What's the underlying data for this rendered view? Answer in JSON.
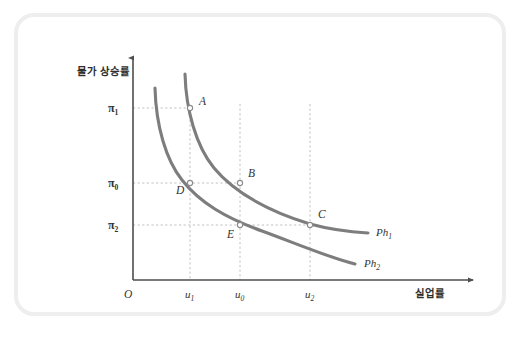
{
  "figure": {
    "kind": "phillips-curve-diagram",
    "frame_color": "#eeeeee",
    "background": "#ffffff"
  },
  "axes": {
    "y_axis_title": "물가 상승률",
    "x_axis_title": "실업률",
    "origin_label": "O",
    "axis_color": "#4d4d4d"
  },
  "y_ticks": [
    {
      "id": "pi1",
      "base": "π",
      "sub": "1",
      "value_y": 108
    },
    {
      "id": "pi0",
      "base": "π",
      "sub": "0",
      "value_y": 183
    },
    {
      "id": "pi2",
      "base": "π",
      "sub": "2",
      "value_y": 225
    }
  ],
  "x_ticks": [
    {
      "id": "u1",
      "base": "u",
      "sub": "1",
      "value_x": 190
    },
    {
      "id": "u0",
      "base": "u",
      "sub": "0",
      "value_x": 240
    },
    {
      "id": "u2",
      "base": "u",
      "sub": "2",
      "value_x": 310
    }
  ],
  "points": [
    {
      "label": "A",
      "x": 190,
      "y": 108,
      "label_dx": 9,
      "label_dy": -3
    },
    {
      "label": "B",
      "x": 240,
      "y": 183,
      "label_dx": 8,
      "label_dy": -6
    },
    {
      "label": "C",
      "x": 310,
      "y": 225,
      "label_dx": 8,
      "label_dy": -7
    },
    {
      "label": "D",
      "x": 190,
      "y": 183,
      "label_dx": -14,
      "label_dy": 11
    },
    {
      "label": "E",
      "x": 240,
      "y": 225,
      "label_dx": -13,
      "label_dy": 13
    }
  ],
  "curves": [
    {
      "id": "Ph1",
      "base": "Ph",
      "sub": "1",
      "color": "#7d7d7d",
      "label_x": 376,
      "label_y": 233,
      "path": "M 185,74 C 186,110 196,146 214,168 C 234,192 268,211 310,224 C 332,230 351,232 368,233"
    },
    {
      "id": "Ph2",
      "base": "Ph",
      "sub": "2",
      "color": "#7d7d7d",
      "label_x": 364,
      "label_y": 264,
      "path": "M 155,88 C 156,126 166,160 182,180 C 200,203 226,218 262,231 C 295,243 330,258 355,264"
    }
  ],
  "chart_data": {
    "type": "line",
    "title": "",
    "xlabel": "실업률",
    "ylabel": "물가 상승률",
    "xlim": [
      0,
      1
    ],
    "ylim": [
      0,
      1
    ],
    "grid": false,
    "legend_position": "right-inline",
    "x_tick_labels": [
      "u₁",
      "u₀",
      "u₂"
    ],
    "y_tick_labels": [
      "π₁",
      "π₀",
      "π₂"
    ],
    "series": [
      {
        "name": "Ph₁",
        "description": "Upper (shifted-out) short-run Phillips curve",
        "points": [
          {
            "label": "A",
            "x": "u₁",
            "y": "π₁"
          },
          {
            "label": "B",
            "x": "u₀",
            "y": "π₀"
          },
          {
            "label": "C",
            "x": "u₂",
            "y": "π₂"
          }
        ]
      },
      {
        "name": "Ph₂",
        "description": "Lower (original) short-run Phillips curve",
        "points": [
          {
            "label": "D",
            "x": "u₁",
            "y": "π₀"
          },
          {
            "label": "E",
            "x": "u₀",
            "y": "π₂"
          }
        ]
      }
    ],
    "annotations": [
      "A",
      "B",
      "C",
      "D",
      "E",
      "Ph₁",
      "Ph₂",
      "O"
    ]
  }
}
